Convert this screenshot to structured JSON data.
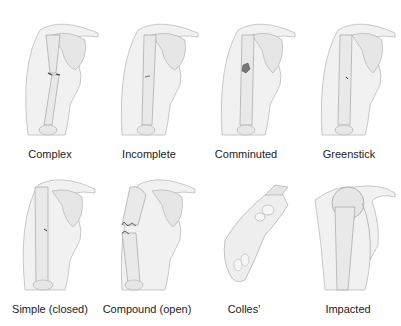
{
  "figure": {
    "panels": [
      {
        "label": "Complex",
        "type": "shoulder",
        "fracture": "complex"
      },
      {
        "label": "Incomplete",
        "type": "shoulder",
        "fracture": "incomplete"
      },
      {
        "label": "Comminuted",
        "type": "shoulder",
        "fracture": "comminuted"
      },
      {
        "label": "Greenstick",
        "type": "shoulder",
        "fracture": "greenstick"
      },
      {
        "label": "Simple (closed)",
        "type": "shoulder",
        "fracture": "simple"
      },
      {
        "label": "Compound (open)",
        "type": "shoulder",
        "fracture": "compound"
      },
      {
        "label": "Colles'",
        "type": "wrist",
        "fracture": "colles"
      },
      {
        "label": "Impacted",
        "type": "shoulder-joint",
        "fracture": "impacted"
      }
    ]
  }
}
